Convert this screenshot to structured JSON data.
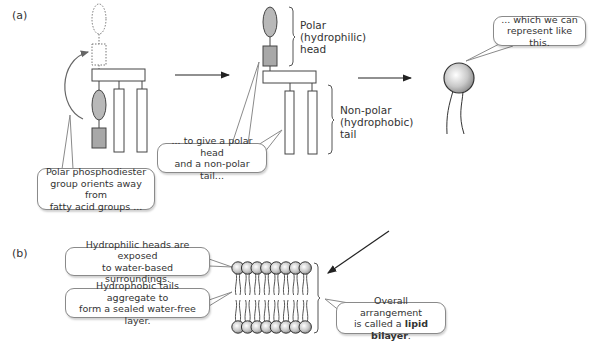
{
  "panels": {
    "a": {
      "label": "(a)"
    },
    "b": {
      "label": "(b)"
    }
  },
  "labels": {
    "head_line1": "Polar",
    "head_line2": "(hydrophilic)",
    "head_line3": "head",
    "tail_line1": "Non-polar",
    "tail_line2": "(hydrophobic)",
    "tail_line3": "tail"
  },
  "callouts": {
    "orient": {
      "line1": "Polar phosphodiester",
      "line2": "group orients away from",
      "line3": "fatty acid groups ..."
    },
    "give": {
      "line1": "... to give a polar head",
      "line2": "and a non-polar tail..."
    },
    "represent": {
      "line1": "... which we can",
      "line2": "represent like this."
    },
    "heads": {
      "line1": "Hydrophilic heads are exposed",
      "line2": "to water-based surroundings."
    },
    "tails": {
      "line1": "Hydrophobic tails aggregate to",
      "line2": "form a sealed water-free layer."
    },
    "bilayer": {
      "line1": "Overall arrangement",
      "line2_prefix": "is called a ",
      "line2_bold": "lipid bilayer",
      "line2_suffix": "."
    }
  },
  "bilayer": {
    "heads_per_leaflet": 8
  },
  "colors": {
    "head_fill": "#b8b8b8",
    "outline": "#555555",
    "line": "#333333"
  }
}
